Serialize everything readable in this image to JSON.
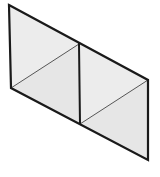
{
  "canvas": {
    "width": 160,
    "height": 177,
    "background_color": "#ffffff",
    "title": "Isometric Panel Wireframe"
  },
  "style": {
    "face_fill_upper": "#ececec",
    "face_fill_lower": "#e6e6e6",
    "outline_color": "#1a1a1a",
    "outline_width": 2.2,
    "divider_color": "#1a1a1a",
    "divider_width": 2.0,
    "diagonal_color": "#555555",
    "diagonal_width": 1.0
  },
  "geometry": {
    "vertices": {
      "top_left": {
        "x": 9,
        "y": 5
      },
      "bottom_left": {
        "x": 11,
        "y": 88
      },
      "mid_top": {
        "x": 79,
        "y": 44
      },
      "mid_bottom": {
        "x": 80,
        "y": 124
      },
      "top_right": {
        "x": 148,
        "y": 80
      },
      "bottom_right": {
        "x": 148,
        "y": 160
      }
    },
    "outline_path": "M 9 5 L 148 80 L 148 160 L 11 88 Z",
    "panels": [
      {
        "name": "left-panel",
        "face_path": "M 9 5 L 79 44 L 80 124 L 11 88 Z",
        "upper_triangle_path": "M 9 5 L 79 44 L 11 88 Z",
        "lower_triangle_path": "M 79 44 L 80 124 L 11 88 Z",
        "diagonal": {
          "x1": 11,
          "y1": 88,
          "x2": 79,
          "y2": 44
        }
      },
      {
        "name": "right-panel",
        "face_path": "M 79 44 L 148 80 L 148 160 L 80 124 Z",
        "upper_triangle_path": "M 79 44 L 148 80 L 80 124 Z",
        "lower_triangle_path": "M 148 80 L 148 160 L 80 124 Z",
        "diagonal": {
          "x1": 80,
          "y1": 124,
          "x2": 148,
          "y2": 80
        }
      }
    ],
    "divider": {
      "x1": 79,
      "y1": 44,
      "x2": 80,
      "y2": 124
    },
    "left_edge": {
      "x1": 9,
      "y1": 5,
      "x2": 11,
      "y2": 88
    },
    "right_edge": {
      "x1": 148,
      "y1": 80,
      "x2": 148,
      "y2": 160
    },
    "top_edge": {
      "x1": 9,
      "y1": 5,
      "x2": 148,
      "y2": 80
    },
    "bottom_edge": {
      "x1": 11,
      "y1": 88,
      "x2": 148,
      "y2": 160
    }
  }
}
